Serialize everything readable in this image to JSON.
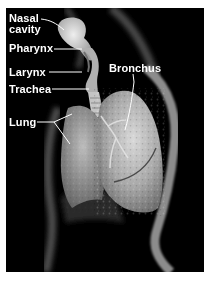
{
  "figure": {
    "background_color": "#000000",
    "border_color": "#ffffff",
    "label_color": "#ffffff",
    "labels": [
      {
        "id": "nasal_cavity",
        "lines": [
          "Nasal",
          "cavity"
        ]
      },
      {
        "id": "pharynx",
        "text": "Pharynx"
      },
      {
        "id": "larynx",
        "text": "Larynx"
      },
      {
        "id": "trachea",
        "text": "Trachea"
      },
      {
        "id": "bronchus",
        "text": "Bronchus"
      },
      {
        "id": "lung",
        "text": "Lung"
      }
    ]
  }
}
